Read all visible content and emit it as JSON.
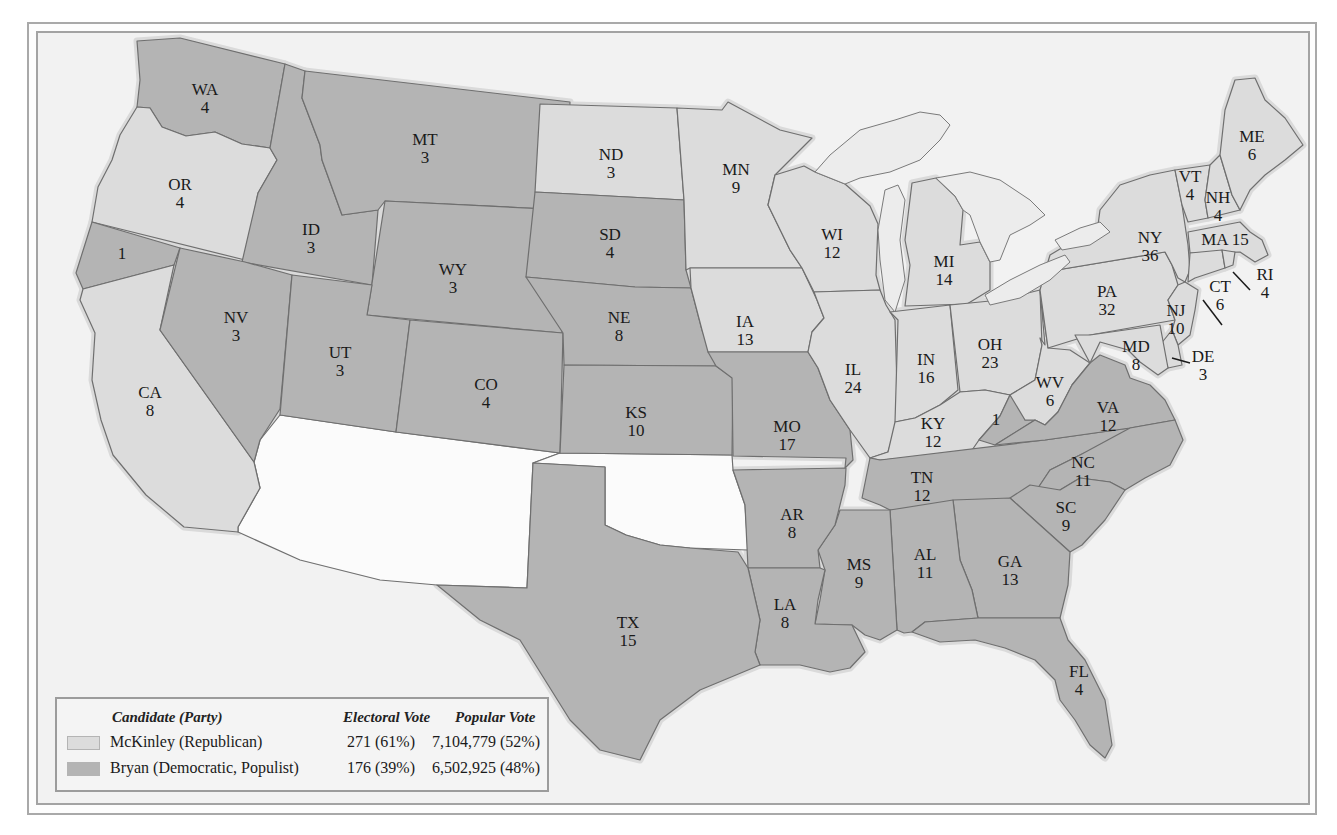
{
  "colors": {
    "mckinley": "#dcdcdc",
    "bryan": "#b4b4b4",
    "territory": "#fbfbfb",
    "water": "#f2f2f2"
  },
  "legend": {
    "headers": {
      "candidate": "Candidate (Party)",
      "electoral": "Electoral Vote",
      "popular": "Popular Vote"
    },
    "rows": [
      {
        "candidate": "McKinley (Republican)",
        "electoral": "271 (61%)",
        "popular": "7,104,779 (52%)",
        "party": "mckinley"
      },
      {
        "candidate": "Bryan (Democratic, Populist)",
        "electoral": "176 (39%)",
        "popular": "6,502,925 (48%)",
        "party": "bryan"
      }
    ]
  },
  "states": [
    {
      "abbr": "WA",
      "votes": "4",
      "winner": "bryan",
      "label": [
        205,
        95
      ],
      "poly": "137,41 180,38 285,64 270,148 242,144 215,132 186,136 162,127 150,108 137,107 140,80"
    },
    {
      "abbr": "OR",
      "votes": "4",
      "winner": "mckinley",
      "label": [
        180,
        190
      ],
      "poly": "137,107 150,108 162,127 186,136 215,132 242,144 270,148 277,160 258,193 245,260 92,222 98,187 112,160 120,135"
    },
    {
      "abbr": "CA-split",
      "votes": "1",
      "winner": "bryan",
      "label": [
        122,
        259
      ],
      "poly": "92,222 180,248 174,265 83,289 76,273"
    },
    {
      "abbr": "CA",
      "votes": "8",
      "winner": "mckinley",
      "label": [
        150,
        398
      ],
      "poly": "83,289 174,265 160,330 254,462 260,488 238,527 238,532 184,527 146,495 113,455 101,420 92,380 95,333 80,300"
    },
    {
      "abbr": "ID",
      "votes": "3",
      "winner": "bryan",
      "label": [
        311,
        235
      ],
      "poly": "285,64 305,71 302,98 320,145 322,160 342,215 378,210 372,285 242,262 258,193 277,160 270,148"
    },
    {
      "abbr": "NV",
      "votes": "3",
      "winner": "bryan",
      "label": [
        236,
        323
      ],
      "poly": "180,248 245,262 292,275 280,409 260,440 254,462 160,330"
    },
    {
      "abbr": "MT",
      "votes": "3",
      "winner": "bryan",
      "label": [
        425,
        145
      ],
      "poly": "305,71 570,102 566,210 385,201 378,210 342,215 322,160 320,145 302,98"
    },
    {
      "abbr": "WY",
      "votes": "3",
      "winner": "bryan",
      "label": [
        453,
        275
      ],
      "poly": "385,201 566,210 562,333 367,315"
    },
    {
      "abbr": "UT",
      "votes": "3",
      "winner": "bryan",
      "label": [
        340,
        358
      ],
      "poly": "292,275 372,285 367,315 410,320 396,432 280,415"
    },
    {
      "abbr": "CO",
      "votes": "4",
      "winner": "bryan",
      "label": [
        486,
        390
      ],
      "poly": "410,320 563,333 560,453 396,432"
    },
    {
      "abbr": "ND",
      "votes": "3",
      "winner": "mckinley",
      "label": [
        611,
        160
      ],
      "poly": "540,104 677,108 684,200 535,192"
    },
    {
      "abbr": "SD",
      "votes": "4",
      "winner": "bryan",
      "label": [
        610,
        240
      ],
      "poly": "535,192 684,200 686,270 691,288 635,287 526,277"
    },
    {
      "abbr": "NE",
      "votes": "8",
      "winner": "bryan",
      "label": [
        619,
        323
      ],
      "poly": "526,277 635,287 691,288 702,330 716,366 564,365 563,333"
    },
    {
      "abbr": "KS",
      "votes": "10",
      "winner": "bryan",
      "label": [
        636,
        418
      ],
      "poly": "564,365 716,366 733,378 732,455 560,453"
    },
    {
      "abbr": "MN",
      "votes": "9",
      "winner": "mckinley",
      "label": [
        736,
        175
      ],
      "poly": "677,108 722,110 728,102 780,130 812,138 775,175 768,205 790,250 802,268 690,268 686,270 684,200"
    },
    {
      "abbr": "IA",
      "votes": "13",
      "winner": "mckinley",
      "label": [
        745,
        327
      ],
      "poly": "690,268 802,268 817,300 824,318 812,332 808,352 708,352 702,330 691,288"
    },
    {
      "abbr": "MO",
      "votes": "17",
      "winner": "bryan",
      "label": [
        787,
        432
      ],
      "poly": "708,352 808,352 818,368 830,400 850,430 853,460 845,468 846,458 733,456 732,378 716,366"
    },
    {
      "abbr": "WI",
      "votes": "12",
      "winner": "mckinley",
      "label": [
        832,
        240
      ],
      "poly": "775,175 804,166 815,172 830,178 845,184 870,206 878,224 876,275 880,290 814,292 802,268 790,250 768,205"
    },
    {
      "abbr": "IL",
      "votes": "24",
      "winner": "mckinley",
      "label": [
        853,
        375
      ],
      "poly": "814,292 880,290 886,305 895,320 898,420 888,452 870,458 850,430 830,400 818,368 808,352 812,332 824,318 817,300"
    },
    {
      "abbr": "MI",
      "votes": "14",
      "winner": "mckinley",
      "label": [
        944,
        267
      ],
      "poly": "912,183 936,178 955,196 963,210 960,245 980,242 990,262 990,290 967,304 905,306 910,265 905,240"
    },
    {
      "abbr": "IN",
      "votes": "16",
      "winner": "mckinley",
      "label": [
        926,
        365
      ],
      "poly": "890,312 950,305 958,390 940,405 915,418 895,422 898,320"
    },
    {
      "abbr": "OH",
      "votes": "23",
      "winner": "mckinley",
      "label": [
        990,
        350
      ],
      "poly": "950,305 1000,300 1040,290 1042,345 1035,380 1010,395 985,390 960,392"
    },
    {
      "abbr": "KY",
      "votes": "12",
      "winner": "mckinley",
      "label": [
        933,
        429
      ],
      "poly": "895,422 915,418 940,405 960,392 985,390 1010,395 1000,416 979,440 970,453 880,460 870,458 888,452"
    },
    {
      "abbr": "KY-split",
      "votes": "1",
      "winner": "bryan",
      "label": [
        996,
        425
      ],
      "poly": "1000,416 1010,395 1020,405 1025,420 1035,420 995,445 979,440"
    },
    {
      "abbr": "TN",
      "votes": "12",
      "winner": "bryan",
      "label": [
        922,
        483
      ],
      "poly": "870,458 880,460 1045,440 1130,428 1115,440 1080,455 1050,470 1030,500 890,510 880,505 862,498"
    },
    {
      "abbr": "WV",
      "votes": "6",
      "winner": "mckinley",
      "label": [
        1050,
        388
      ],
      "poly": "1040,290 1045,345 1040,338 1042,345 1035,380 1010,395 1025,420 1035,420 1045,425 1058,412 1072,385 1090,363 1070,350 1048,348"
    },
    {
      "abbr": "VA",
      "votes": "12",
      "winner": "bryan",
      "label": [
        1108,
        413
      ],
      "poly": "1035,420 1045,425 1058,412 1072,385 1090,363 1100,355 1125,365 1130,378 1150,385 1165,400 1175,420 1130,428 1045,440 995,445"
    },
    {
      "abbr": "NC",
      "votes": "11",
      "winner": "bryan",
      "label": [
        1083,
        468
      ],
      "poly": "1030,500 1050,470 1080,455 1130,428 1175,420 1183,440 1170,465 1145,478 1125,490 1110,482 1080,478 1060,490"
    },
    {
      "abbr": "SC",
      "votes": "9",
      "winner": "bryan",
      "label": [
        1066,
        513
      ],
      "poly": "1010,498 1030,485 1060,490 1080,478 1110,482 1125,490 1105,520 1082,545 1070,552 1040,525"
    },
    {
      "abbr": "GA",
      "votes": "13",
      "winner": "bryan",
      "label": [
        1010,
        567
      ],
      "poly": "953,500 1010,498 1040,525 1070,552 1068,585 1060,618 978,618 972,590 960,560"
    },
    {
      "abbr": "AL",
      "votes": "11",
      "winner": "bryan",
      "label": [
        925,
        560
      ],
      "poly": "890,510 953,500 960,560 972,590 978,618 925,622 912,632 904,633 897,630"
    },
    {
      "abbr": "MS",
      "votes": "9",
      "winner": "bryan",
      "label": [
        859,
        570
      ],
      "poly": "840,510 890,510 897,630 880,640 865,635 852,625 815,624 820,600 825,570 818,550 835,525"
    },
    {
      "abbr": "AR",
      "votes": "8",
      "winner": "bryan",
      "label": [
        792,
        520
      ],
      "poly": "733,470 846,468 845,485 835,525 818,550 820,568 748,568 745,505"
    },
    {
      "abbr": "LA",
      "votes": "8",
      "winner": "bryan",
      "label": [
        785,
        610
      ],
      "poly": "748,568 820,568 825,570 818,600 815,624 852,625 865,652 850,668 830,672 800,665 760,665 755,652 760,620"
    },
    {
      "abbr": "TX",
      "votes": "15",
      "winner": "bryan",
      "label": [
        628,
        628
      ],
      "poly": "533,463 605,467 605,525 626,535 660,545 690,548 738,552 748,568 760,620 755,652 760,665 700,690 660,720 640,760 600,750 570,720 545,680 520,640 480,620 437,585 527,588"
    },
    {
      "abbr": "FL",
      "votes": "4",
      "winner": "bryan",
      "label": [
        1079,
        677
      ],
      "poly": "912,632 925,622 978,618 1060,618 1068,640 1085,660 1105,700 1112,745 1105,758 1090,745 1075,720 1060,700 1055,680 1035,660 1005,648 975,640 940,642"
    },
    {
      "abbr": "PA",
      "votes": "32",
      "winner": "mckinley",
      "label": [
        1107,
        297
      ],
      "poly": "1040,290 1045,272 1165,252 1172,265 1178,285 1168,300 1175,320 1090,335 1048,348"
    },
    {
      "abbr": "NY",
      "votes": "36",
      "winner": "mckinley",
      "label": [
        1150,
        243
      ],
      "poly": "1045,272 1050,255 1075,240 1098,225 1100,210 1120,185 1150,175 1175,170 1182,205 1188,245 1190,270 1185,282 1178,278 1172,265 1165,252"
    },
    {
      "abbr": "VT",
      "votes": "4",
      "winner": "mckinley",
      "label": [
        1190,
        182
      ],
      "poly": "1175,170 1210,165 1205,200 1208,218 1188,222 1182,205"
    },
    {
      "abbr": "NH",
      "votes": "4",
      "winner": "mckinley",
      "label": [
        1218,
        203
      ],
      "poly": "1210,165 1220,155 1232,195 1240,210 1208,218 1205,200"
    },
    {
      "abbr": "ME",
      "votes": "6",
      "winner": "mckinley",
      "label": [
        1252,
        142
      ],
      "poly": "1220,155 1225,110 1235,80 1255,78 1265,100 1285,118 1303,145 1285,160 1265,175 1250,190 1240,210 1232,195"
    },
    {
      "abbr": "MA",
      "votes": "15",
      "winner": "mckinley",
      "label": [
        1225,
        245
      ],
      "poly": "1188,232 1240,222 1250,232 1262,240 1268,255 1255,262 1240,252 1190,253"
    },
    {
      "abbr": "CT",
      "votes": "6",
      "winner": "mckinley",
      "label": [
        1220,
        292
      ],
      "poly": "1190,253 1222,250 1225,268 1195,278 1188,282"
    },
    {
      "abbr": "RI",
      "votes": "4",
      "winner": "mckinley",
      "label": [
        1265,
        280
      ],
      "poly": "1222,250 1235,252 1233,265 1225,268"
    },
    {
      "abbr": "NJ",
      "votes": "10",
      "winner": "mckinley",
      "label": [
        1176,
        316
      ],
      "poly": "1168,300 1178,285 1185,282 1198,290 1195,310 1190,335 1178,345 1172,330 1175,320"
    },
    {
      "abbr": "DE",
      "votes": "3",
      "winner": "mckinley",
      "label": [
        1203,
        362
      ],
      "poly": "1160,345 1172,330 1178,345 1182,365 1168,368"
    },
    {
      "abbr": "MD",
      "votes": "8",
      "winner": "mckinley",
      "label": [
        1136,
        352
      ],
      "poly": "1075,335 1090,335 1160,325 1168,368 1158,375 1140,362 1128,350 1100,342 1090,363"
    }
  ],
  "territories": [
    {
      "name": "AZ-NM territory",
      "poly": "280,415 396,432 560,453 533,463 527,588 437,585 380,580 300,560 238,532 238,527 260,488 254,462 260,440"
    },
    {
      "name": "OK territory",
      "poly": "560,453 732,455 733,470 745,505 748,550 690,548 660,545 626,535 605,525 605,467 533,463"
    }
  ],
  "lakes": [
    {
      "name": "superior",
      "poly": "815,172 830,155 860,130 895,120 920,112 940,115 950,125 940,140 920,160 890,172 860,178 845,184"
    },
    {
      "name": "michigan",
      "poly": "885,190 898,185 905,200 900,240 905,280 895,312 885,300 880,260 878,230"
    },
    {
      "name": "huron",
      "poly": "936,178 970,172 1000,180 1030,200 1045,215 1030,225 1010,235 1000,260 990,262 980,242 970,215 963,210 955,196"
    },
    {
      "name": "erie",
      "poly": "985,295 1010,280 1040,265 1065,255 1070,262 1050,280 1020,298 990,305"
    },
    {
      "name": "ontario",
      "poly": "1055,240 1080,228 1100,222 1110,232 1090,245 1062,250"
    }
  ],
  "leaders": [
    {
      "from": [
        1203,
        300
      ],
      "to": [
        1222,
        325
      ]
    },
    {
      "from": [
        1233,
        272
      ],
      "to": [
        1250,
        290
      ]
    },
    {
      "from": [
        1172,
        358
      ],
      "to": [
        1190,
        363
      ]
    }
  ]
}
